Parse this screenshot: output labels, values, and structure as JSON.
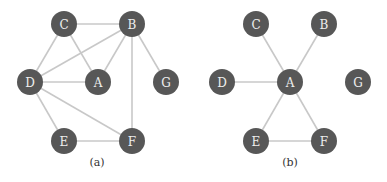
{
  "colors": {
    "node": "#575757",
    "node_label": "#eeeeee",
    "edge": "#c8c8c8",
    "caption": "#333333"
  },
  "node_radius": 13,
  "graphs": [
    {
      "id": "a",
      "caption": "(a)",
      "caption_pos": [
        97,
        162
      ],
      "nodes": [
        {
          "id": "C",
          "label": "C",
          "x": 64,
          "y": 24
        },
        {
          "id": "B",
          "label": "B",
          "x": 132,
          "y": 24
        },
        {
          "id": "D",
          "label": "D",
          "x": 30,
          "y": 82
        },
        {
          "id": "A",
          "label": "A",
          "x": 98,
          "y": 82
        },
        {
          "id": "G",
          "label": "G",
          "x": 166,
          "y": 82
        },
        {
          "id": "E",
          "label": "E",
          "x": 64,
          "y": 141
        },
        {
          "id": "F",
          "label": "F",
          "x": 132,
          "y": 141
        }
      ],
      "edges": [
        [
          "C",
          "B"
        ],
        [
          "C",
          "D"
        ],
        [
          "C",
          "A"
        ],
        [
          "B",
          "D"
        ],
        [
          "B",
          "A"
        ],
        [
          "B",
          "G"
        ],
        [
          "B",
          "F"
        ],
        [
          "D",
          "A"
        ],
        [
          "D",
          "E"
        ],
        [
          "D",
          "F"
        ],
        [
          "E",
          "F"
        ]
      ]
    },
    {
      "id": "b",
      "caption": "(b)",
      "caption_pos": [
        290,
        162
      ],
      "nodes": [
        {
          "id": "C",
          "label": "C",
          "x": 256,
          "y": 24
        },
        {
          "id": "B",
          "label": "B",
          "x": 324,
          "y": 24
        },
        {
          "id": "D",
          "label": "D",
          "x": 222,
          "y": 82
        },
        {
          "id": "A",
          "label": "A",
          "x": 290,
          "y": 82
        },
        {
          "id": "G",
          "label": "G",
          "x": 358,
          "y": 82
        },
        {
          "id": "E",
          "label": "E",
          "x": 256,
          "y": 141
        },
        {
          "id": "F",
          "label": "F",
          "x": 324,
          "y": 141
        }
      ],
      "edges": [
        [
          "A",
          "C"
        ],
        [
          "A",
          "B"
        ],
        [
          "A",
          "D"
        ],
        [
          "A",
          "E"
        ],
        [
          "A",
          "F"
        ],
        [
          "E",
          "F"
        ]
      ]
    }
  ]
}
